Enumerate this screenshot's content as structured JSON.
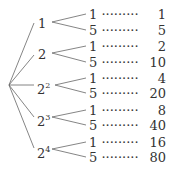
{
  "diagram": {
    "type": "tree",
    "root": "",
    "branches": [
      {
        "label": "1",
        "exp": "",
        "leaves": [
          {
            "factor": "1",
            "result": "1"
          },
          {
            "factor": "5",
            "result": "5"
          }
        ]
      },
      {
        "label": "2",
        "exp": "",
        "leaves": [
          {
            "factor": "1",
            "result": "2"
          },
          {
            "factor": "5",
            "result": "10"
          }
        ]
      },
      {
        "label": "2",
        "exp": "2",
        "leaves": [
          {
            "factor": "1",
            "result": "4"
          },
          {
            "factor": "5",
            "result": "20"
          }
        ]
      },
      {
        "label": "2",
        "exp": "3",
        "leaves": [
          {
            "factor": "1",
            "result": "8"
          },
          {
            "factor": "5",
            "result": "40"
          }
        ]
      },
      {
        "label": "2",
        "exp": "4",
        "leaves": [
          {
            "factor": "1",
            "result": "16"
          },
          {
            "factor": "5",
            "result": "80"
          }
        ]
      }
    ],
    "dots": "·········",
    "line_color": "#555555"
  }
}
